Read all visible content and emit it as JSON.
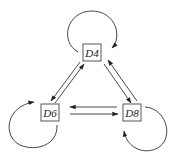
{
  "diagram": {
    "type": "state-transition-graph",
    "colors": {
      "stroke": "#333333",
      "box_stroke": "#444444",
      "text": "#222222",
      "background": "#ffffff"
    },
    "nodes": [
      {
        "id": "D4",
        "label": "D4",
        "position": "top"
      },
      {
        "id": "D6",
        "label": "D6",
        "position": "bottom-left"
      },
      {
        "id": "D8",
        "label": "D8",
        "position": "bottom-right"
      }
    ],
    "edges": [
      {
        "from": "D4",
        "to": "D4",
        "kind": "self-loop"
      },
      {
        "from": "D6",
        "to": "D6",
        "kind": "self-loop"
      },
      {
        "from": "D8",
        "to": "D8",
        "kind": "self-loop"
      },
      {
        "from": "D4",
        "to": "D6"
      },
      {
        "from": "D6",
        "to": "D4"
      },
      {
        "from": "D4",
        "to": "D8"
      },
      {
        "from": "D8",
        "to": "D4"
      },
      {
        "from": "D6",
        "to": "D8"
      },
      {
        "from": "D8",
        "to": "D6"
      }
    ]
  }
}
